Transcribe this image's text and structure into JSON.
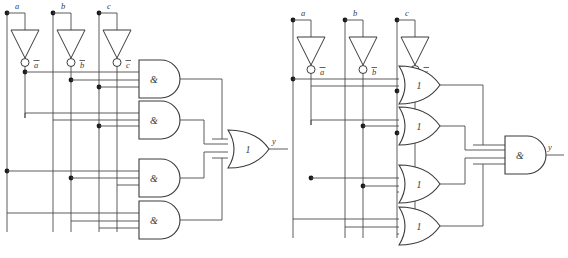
{
  "figure": {
    "type": "logic-circuit-diagram",
    "background_color": "#ffffff",
    "wire_color": "#4a4a4a",
    "gate_outline_color": "#3a3a3a"
  },
  "circuits": [
    {
      "id": "left",
      "name": "and-or-circuit",
      "structure": "sum-of-products",
      "inputs": [
        {
          "label": "a",
          "inverted_label": "a",
          "overbar": true
        },
        {
          "label": "b",
          "inverted_label": "b",
          "overbar": true
        },
        {
          "label": "c",
          "inverted_label": "c",
          "overbar": true
        }
      ],
      "inverters": [
        {
          "name": "inverter-a",
          "input": "a",
          "output": "a-bar"
        },
        {
          "name": "inverter-b",
          "input": "b",
          "output": "b-bar"
        },
        {
          "name": "inverter-c",
          "input": "c",
          "output": "c-bar"
        }
      ],
      "stage1_gates": [
        {
          "name": "and-gate-1",
          "symbol": "&",
          "inputs": [
            "a-bar",
            "b-bar",
            "c-bar"
          ]
        },
        {
          "name": "and-gate-2",
          "symbol": "&",
          "inputs": [
            "a-bar",
            "b-bar",
            "c"
          ]
        },
        {
          "name": "and-gate-3",
          "symbol": "&",
          "inputs": [
            "a",
            "b-bar",
            "c-bar"
          ]
        },
        {
          "name": "and-gate-4",
          "symbol": "&",
          "inputs": [
            "a",
            "b",
            "c-bar"
          ]
        }
      ],
      "stage2_gate": {
        "name": "or-gate-output",
        "symbol": "1",
        "inputs": 4
      },
      "output": {
        "label": "y"
      }
    },
    {
      "id": "right",
      "name": "or-and-circuit",
      "structure": "product-of-sums",
      "inputs": [
        {
          "label": "a",
          "inverted_label": "a",
          "overbar": true
        },
        {
          "label": "b",
          "inverted_label": "b",
          "overbar": true
        },
        {
          "label": "c",
          "inverted_label": "c",
          "overbar": true
        }
      ],
      "inverters": [
        {
          "name": "inverter-a",
          "input": "a",
          "output": "a-bar"
        },
        {
          "name": "inverter-b",
          "input": "b",
          "output": "b-bar"
        },
        {
          "name": "inverter-c",
          "input": "c",
          "output": "c-bar"
        }
      ],
      "stage1_gates": [
        {
          "name": "or-gate-1",
          "symbol": "1",
          "inputs": [
            "a-bar",
            "b-bar",
            "c-bar"
          ]
        },
        {
          "name": "or-gate-2",
          "symbol": "1",
          "inputs": [
            "a-bar",
            "b-bar",
            "c"
          ]
        },
        {
          "name": "or-gate-3",
          "symbol": "1",
          "inputs": [
            "a",
            "b-bar",
            "c-bar"
          ]
        },
        {
          "name": "or-gate-4",
          "symbol": "1",
          "inputs": [
            "a",
            "b",
            "c-bar"
          ]
        }
      ],
      "stage2_gate": {
        "name": "and-gate-output",
        "symbol": "&",
        "inputs": 4
      },
      "output": {
        "label": "y"
      }
    }
  ],
  "labels": {
    "input_a": "a",
    "input_b": "b",
    "input_c": "c",
    "inv_a": "a",
    "inv_b": "b",
    "inv_c": "c",
    "output_y": "y",
    "and_symbol": "&",
    "or_symbol": "1"
  }
}
